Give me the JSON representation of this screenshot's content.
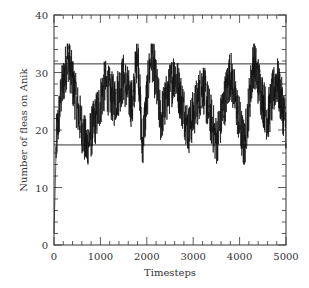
{
  "chart_data": {
    "type": "line",
    "title": "",
    "xlabel": "Timesteps",
    "ylabel": "Number of fleas on Anik",
    "xlim": [
      0,
      5000
    ],
    "ylim": [
      0,
      40
    ],
    "xticks": [
      0,
      1000,
      2000,
      3000,
      4000,
      5000
    ],
    "yticks": [
      0,
      10,
      20,
      30,
      40
    ],
    "x_minor_step": 200,
    "y_minor_step": 2,
    "grid": false,
    "legend": null,
    "reference_lines": [
      {
        "name": "upper-bound",
        "y": 31.5
      },
      {
        "name": "lower-bound",
        "y": 17.4
      }
    ],
    "series": [
      {
        "name": "fleas",
        "description": "noisy time series starting at ~0, rising rapidly to fluctuate around ~25 between ~15 and ~35",
        "start_value": 0,
        "mean": 25,
        "min_observed": 15,
        "max_observed": 35,
        "sample_points": [
          {
            "x": 0,
            "y": 2
          },
          {
            "x": 50,
            "y": 18
          },
          {
            "x": 150,
            "y": 26
          },
          {
            "x": 300,
            "y": 33
          },
          {
            "x": 500,
            "y": 24
          },
          {
            "x": 700,
            "y": 17
          },
          {
            "x": 900,
            "y": 22
          },
          {
            "x": 1100,
            "y": 28
          },
          {
            "x": 1300,
            "y": 25
          },
          {
            "x": 1500,
            "y": 29
          },
          {
            "x": 1700,
            "y": 24
          },
          {
            "x": 1800,
            "y": 35
          },
          {
            "x": 1900,
            "y": 17
          },
          {
            "x": 2100,
            "y": 34
          },
          {
            "x": 2300,
            "y": 22
          },
          {
            "x": 2600,
            "y": 30
          },
          {
            "x": 2900,
            "y": 20
          },
          {
            "x": 3200,
            "y": 28
          },
          {
            "x": 3500,
            "y": 18
          },
          {
            "x": 3800,
            "y": 30
          },
          {
            "x": 4100,
            "y": 17
          },
          {
            "x": 4300,
            "y": 32
          },
          {
            "x": 4600,
            "y": 22
          },
          {
            "x": 4800,
            "y": 29
          },
          {
            "x": 5000,
            "y": 21
          }
        ]
      }
    ],
    "line_color": "#111111",
    "axis_color": "#333333",
    "background": "#ffffff"
  }
}
